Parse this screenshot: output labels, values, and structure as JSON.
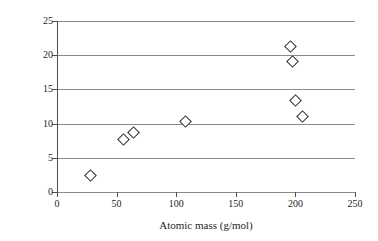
{
  "chart_data": {
    "type": "scatter",
    "title": "",
    "xlabel": "Atomic mass (g/mol)",
    "ylabel_text": "Density (g/cm",
    "ylabel_sup": "3",
    "ylabel_tail": ")",
    "ylabel": "Density (g/cm3)",
    "xlim": [
      0,
      250
    ],
    "ylim": [
      0,
      25
    ],
    "xticks": [
      0,
      50,
      100,
      150,
      200,
      250
    ],
    "yticks": [
      0,
      5,
      10,
      15,
      20,
      25
    ],
    "xtick_labels": [
      "0",
      "50",
      "100",
      "150",
      "200",
      "250"
    ],
    "ytick_labels": [
      "0",
      "5",
      "10",
      "15",
      "20",
      "25"
    ],
    "grid": "horizontal",
    "legend": "none",
    "marker": "open-diamond",
    "marker_color": "#2b2b2b",
    "grid_color": "#8a8a8a",
    "points": [
      {
        "x": 27,
        "y": 2.6
      },
      {
        "x": 55,
        "y": 7.8
      },
      {
        "x": 63,
        "y": 8.9
      },
      {
        "x": 107,
        "y": 10.4
      },
      {
        "x": 195,
        "y": 21.4
      },
      {
        "x": 197,
        "y": 19.2
      },
      {
        "x": 199,
        "y": 13.5
      },
      {
        "x": 205,
        "y": 11.2
      }
    ]
  }
}
